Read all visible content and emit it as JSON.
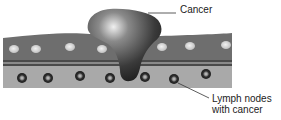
{
  "diagram": {
    "type": "medical-illustration",
    "labels": {
      "cancer": "Cancer",
      "lymph_line1": "Lymph nodes",
      "lymph_line2": "with cancer"
    },
    "colors": {
      "background": "#ffffff",
      "upper_band": "#6e6e6e",
      "lower_band": "#a9a9a9",
      "separator": "#4a4a4a",
      "tumor": "#3a3a3a",
      "cell": "#d6d6d6",
      "node_ring": "#2e2e2e",
      "node_center": "#9a9a9a",
      "leader_line": "#333333",
      "text": "#222222"
    },
    "upper_cells_x": [
      14,
      36,
      70,
      102,
      162,
      190,
      226
    ],
    "lymph_nodes_x": [
      22,
      48,
      80,
      110,
      145,
      174,
      206
    ]
  }
}
